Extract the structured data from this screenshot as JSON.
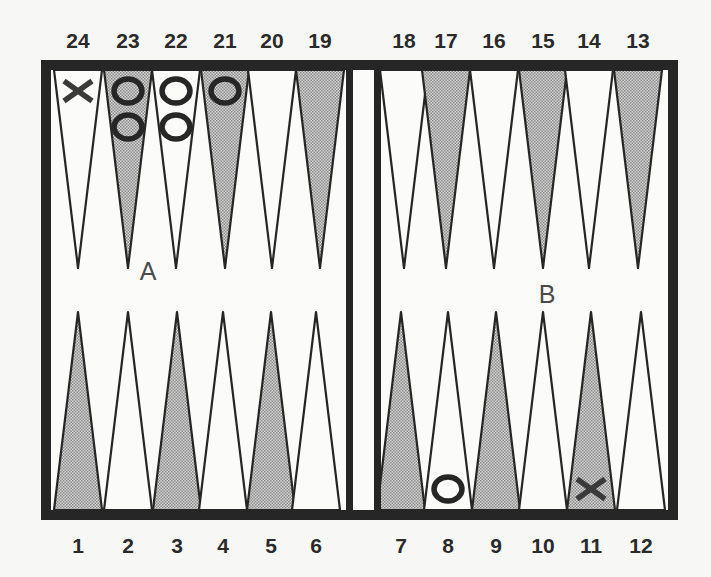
{
  "board": {
    "title": "Backgammon board diagram",
    "colors": {
      "frame": "#262626",
      "line": "#262626",
      "shaded_point": "#bdbdbd",
      "background": "#f7f7f5",
      "checker_x": "#3a3a3a",
      "checker_o": "#262626"
    },
    "zone_labels": [
      {
        "label": "A",
        "x": 148,
        "y": 280
      },
      {
        "label": "B",
        "x": 547,
        "y": 303
      }
    ],
    "top_points": [
      {
        "number": "24",
        "x": 78,
        "shaded": false
      },
      {
        "number": "23",
        "x": 128,
        "shaded": true
      },
      {
        "number": "22",
        "x": 176,
        "shaded": false
      },
      {
        "number": "21",
        "x": 225,
        "shaded": true
      },
      {
        "number": "20",
        "x": 272,
        "shaded": false
      },
      {
        "number": "19",
        "x": 320,
        "shaded": true
      },
      {
        "number": "18",
        "x": 404,
        "shaded": false
      },
      {
        "number": "17",
        "x": 446,
        "shaded": true
      },
      {
        "number": "16",
        "x": 494,
        "shaded": false
      },
      {
        "number": "15",
        "x": 543,
        "shaded": true
      },
      {
        "number": "14",
        "x": 589,
        "shaded": false
      },
      {
        "number": "13",
        "x": 638,
        "shaded": true
      }
    ],
    "bottom_points": [
      {
        "number": "1",
        "x": 78,
        "shaded": true
      },
      {
        "number": "2",
        "x": 128,
        "shaded": false
      },
      {
        "number": "3",
        "x": 177,
        "shaded": true
      },
      {
        "number": "4",
        "x": 223,
        "shaded": false
      },
      {
        "number": "5",
        "x": 271,
        "shaded": true
      },
      {
        "number": "6",
        "x": 316,
        "shaded": false
      },
      {
        "number": "7",
        "x": 401,
        "shaded": true
      },
      {
        "number": "8",
        "x": 448,
        "shaded": false
      },
      {
        "number": "9",
        "x": 496,
        "shaded": true
      },
      {
        "number": "10",
        "x": 543,
        "shaded": false
      },
      {
        "number": "11",
        "x": 591,
        "shaded": true
      },
      {
        "number": "12",
        "x": 641,
        "shaded": false
      }
    ],
    "checkers": [
      {
        "point": "24",
        "type": "X",
        "count": 1
      },
      {
        "point": "23",
        "type": "O",
        "count": 2
      },
      {
        "point": "22",
        "type": "O",
        "count": 2
      },
      {
        "point": "21",
        "type": "O",
        "count": 1
      },
      {
        "point": "8",
        "type": "O",
        "count": 1
      },
      {
        "point": "11",
        "type": "X",
        "count": 1
      }
    ]
  }
}
